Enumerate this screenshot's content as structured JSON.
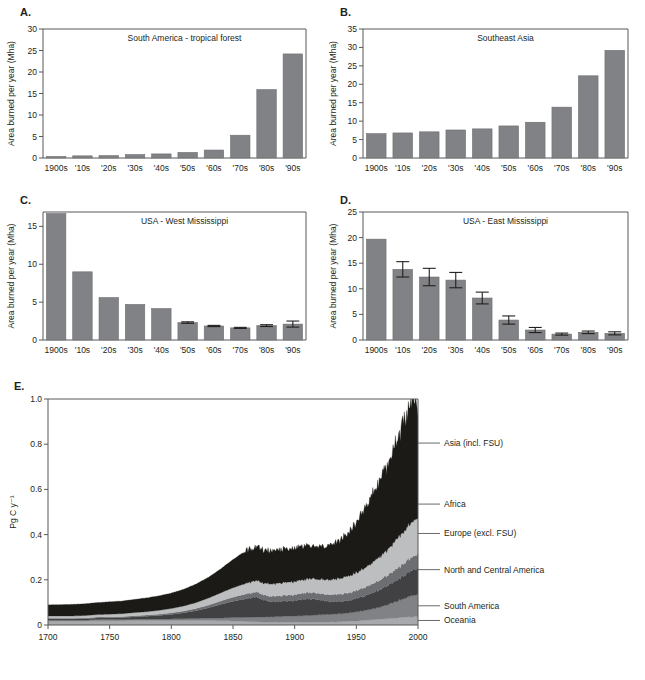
{
  "figure": {
    "panels": [
      "A.",
      "B.",
      "C.",
      "D.",
      "E."
    ]
  },
  "chart_data": [
    {
      "panel": "A.",
      "type": "bar",
      "title": "South America - tropical forest",
      "xlabel": "",
      "ylabel": "Area burned per year (Mha)",
      "categories": [
        "1900s",
        "'10s",
        "'20s",
        "'30s",
        "'40s",
        "'50s",
        "'60s",
        "'70s",
        "'80s",
        "'90s"
      ],
      "values": [
        0.35,
        0.5,
        0.55,
        0.8,
        0.95,
        1.3,
        1.85,
        5.3,
        15.9,
        24.2
      ],
      "errors": [
        0,
        0,
        0,
        0,
        0,
        0,
        0,
        0,
        0,
        0
      ],
      "ylim": [
        0,
        30
      ],
      "yticks": [
        0,
        5,
        10,
        15,
        20,
        25,
        30
      ],
      "grid": false
    },
    {
      "panel": "B.",
      "type": "bar",
      "title": "Southeast Asia",
      "xlabel": "",
      "ylabel": "Area burned per year (Mha)",
      "categories": [
        "1900s",
        "'10s",
        "'20s",
        "'30s",
        "'40s",
        "'50s",
        "'60s",
        "'70s",
        "'80s",
        "'90s"
      ],
      "values": [
        6.6,
        6.8,
        7.1,
        7.6,
        7.9,
        8.7,
        9.7,
        13.8,
        22.3,
        29.2
      ],
      "errors": [
        0,
        0,
        0,
        0,
        0,
        0,
        0,
        0,
        0,
        0
      ],
      "ylim": [
        0,
        35
      ],
      "yticks": [
        0,
        5,
        10,
        15,
        20,
        25,
        30,
        35
      ],
      "grid": false
    },
    {
      "panel": "C.",
      "type": "bar",
      "title": "USA - West Mississippi",
      "xlabel": "",
      "ylabel": "Area burned per year (Mha)",
      "categories": [
        "1900s",
        "'10s",
        "'20s",
        "'30s",
        "'40s",
        "'50s",
        "'60s",
        "'70s",
        "'80s",
        "'90s"
      ],
      "values": [
        16.7,
        9.0,
        5.6,
        4.7,
        4.15,
        2.3,
        1.85,
        1.6,
        1.9,
        2.1
      ],
      "errors": [
        0,
        0,
        0,
        0,
        0,
        0.1,
        0.08,
        0.07,
        0.12,
        0.4
      ],
      "ylim": [
        0,
        16.9
      ],
      "yticks": [
        0,
        5,
        10,
        15
      ],
      "grid": false
    },
    {
      "panel": "D.",
      "type": "bar",
      "title": "USA - East Mississippi",
      "xlabel": "",
      "ylabel": "Area burned per year (Mha)",
      "categories": [
        "1900s",
        "'10s",
        "'20s",
        "'30s",
        "'40s",
        "'50s",
        "'60s",
        "'70s",
        "'80s",
        "'90s"
      ],
      "values": [
        19.7,
        13.8,
        12.3,
        11.7,
        8.2,
        3.9,
        1.95,
        1.15,
        1.5,
        1.3
      ],
      "errors": [
        0,
        1.5,
        1.7,
        1.5,
        1.15,
        0.8,
        0.5,
        0.2,
        0.25,
        0.3
      ],
      "ylim": [
        0,
        25
      ],
      "yticks": [
        0,
        5,
        10,
        15,
        20,
        25
      ],
      "grid": false
    },
    {
      "panel": "E.",
      "type": "area",
      "title": "",
      "xlabel": "",
      "ylabel": "Pg C y⁻¹",
      "xlim": [
        1700,
        2000
      ],
      "ylim": [
        0,
        1.0
      ],
      "xticks": [
        1700,
        1750,
        1800,
        1850,
        1900,
        1950,
        2000
      ],
      "yticks": [
        0,
        0.2,
        0.4,
        0.6,
        0.8,
        1.0
      ],
      "ytick_labels": [
        "0",
        "0.2",
        "0.4",
        "0.6",
        "0.8",
        "1.0"
      ],
      "legend_position": "right-leader-lines",
      "grid": false,
      "x": [
        1700,
        1710,
        1720,
        1730,
        1740,
        1750,
        1760,
        1770,
        1780,
        1790,
        1800,
        1810,
        1820,
        1830,
        1840,
        1850,
        1860,
        1870,
        1875,
        1880,
        1890,
        1900,
        1905,
        1910,
        1915,
        1920,
        1925,
        1930,
        1935,
        1940,
        1945,
        1950,
        1955,
        1960,
        1965,
        1970,
        1975,
        1980,
        1985,
        1990,
        1993,
        1995,
        1997,
        1998,
        2000
      ],
      "series": [
        {
          "name": "Oceania",
          "color": "#a7a9ac",
          "values": [
            0.018,
            0.018,
            0.018,
            0.018,
            0.019,
            0.019,
            0.019,
            0.02,
            0.02,
            0.02,
            0.02,
            0.02,
            0.02,
            0.02,
            0.019,
            0.018,
            0.016,
            0.014,
            0.013,
            0.012,
            0.012,
            0.012,
            0.012,
            0.012,
            0.012,
            0.013,
            0.013,
            0.014,
            0.014,
            0.015,
            0.016,
            0.018,
            0.02,
            0.022,
            0.024,
            0.026,
            0.028,
            0.03,
            0.032,
            0.034,
            0.035,
            0.036,
            0.037,
            0.037,
            0.038
          ]
        },
        {
          "name": "South America",
          "color": "#808285",
          "values": [
            0.004,
            0.004,
            0.004,
            0.004,
            0.005,
            0.005,
            0.005,
            0.005,
            0.006,
            0.006,
            0.007,
            0.008,
            0.009,
            0.01,
            0.012,
            0.015,
            0.018,
            0.021,
            0.022,
            0.024,
            0.026,
            0.028,
            0.029,
            0.03,
            0.031,
            0.032,
            0.033,
            0.034,
            0.035,
            0.036,
            0.038,
            0.04,
            0.043,
            0.046,
            0.05,
            0.055,
            0.062,
            0.07,
            0.078,
            0.085,
            0.09,
            0.092,
            0.095,
            0.096,
            0.098
          ]
        },
        {
          "name": "North and Central America",
          "color": "#414042",
          "values": [
            0.005,
            0.005,
            0.005,
            0.006,
            0.007,
            0.008,
            0.009,
            0.011,
            0.013,
            0.016,
            0.02,
            0.026,
            0.034,
            0.046,
            0.06,
            0.072,
            0.082,
            0.088,
            0.075,
            0.068,
            0.066,
            0.07,
            0.072,
            0.074,
            0.072,
            0.066,
            0.06,
            0.056,
            0.054,
            0.054,
            0.056,
            0.06,
            0.064,
            0.068,
            0.073,
            0.078,
            0.084,
            0.09,
            0.097,
            0.104,
            0.108,
            0.11,
            0.113,
            0.114,
            0.116
          ]
        },
        {
          "name": "Europe (excl. FSU)",
          "color": "#6d6e71",
          "values": [
            0.003,
            0.003,
            0.003,
            0.003,
            0.004,
            0.004,
            0.004,
            0.005,
            0.005,
            0.006,
            0.007,
            0.008,
            0.01,
            0.012,
            0.015,
            0.018,
            0.021,
            0.023,
            0.023,
            0.024,
            0.025,
            0.026,
            0.027,
            0.028,
            0.028,
            0.029,
            0.03,
            0.031,
            0.032,
            0.033,
            0.034,
            0.035,
            0.037,
            0.039,
            0.041,
            0.043,
            0.046,
            0.049,
            0.052,
            0.055,
            0.057,
            0.058,
            0.06,
            0.06,
            0.062
          ]
        },
        {
          "name": "Africa",
          "color": "#bcbec0",
          "values": [
            0.01,
            0.01,
            0.01,
            0.011,
            0.011,
            0.012,
            0.013,
            0.014,
            0.015,
            0.017,
            0.019,
            0.022,
            0.026,
            0.031,
            0.036,
            0.042,
            0.047,
            0.051,
            0.052,
            0.054,
            0.056,
            0.058,
            0.059,
            0.06,
            0.062,
            0.063,
            0.065,
            0.067,
            0.069,
            0.072,
            0.075,
            0.079,
            0.084,
            0.09,
            0.097,
            0.105,
            0.114,
            0.124,
            0.134,
            0.144,
            0.15,
            0.154,
            0.158,
            0.159,
            0.162
          ]
        },
        {
          "name": "Asia (incl. FSU)",
          "color": "#1c1a17",
          "values": [
            0.049,
            0.05,
            0.051,
            0.052,
            0.053,
            0.055,
            0.056,
            0.058,
            0.061,
            0.064,
            0.068,
            0.074,
            0.082,
            0.092,
            0.106,
            0.125,
            0.142,
            0.152,
            0.15,
            0.148,
            0.146,
            0.148,
            0.15,
            0.152,
            0.15,
            0.146,
            0.148,
            0.155,
            0.165,
            0.18,
            0.2,
            0.225,
            0.252,
            0.282,
            0.312,
            0.345,
            0.382,
            0.42,
            0.458,
            0.5,
            0.53,
            0.545,
            0.56,
            0.565,
            0.475
          ]
        }
      ],
      "legend": [
        {
          "label": "Asia (incl. FSU)",
          "y_anchor": 0.805
        },
        {
          "label": "Africa",
          "y_anchor": 0.535
        },
        {
          "label": "Europe (excl. FSU)",
          "y_anchor": 0.405
        },
        {
          "label": "North and Central America",
          "y_anchor": 0.245
        },
        {
          "label": "South America",
          "y_anchor": 0.085
        },
        {
          "label": "Oceania",
          "y_anchor": 0.02
        }
      ]
    }
  ]
}
